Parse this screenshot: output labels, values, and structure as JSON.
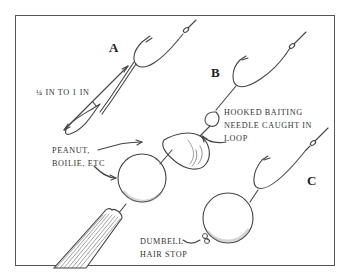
{
  "figure": {
    "panel_labels": {
      "a": "A",
      "b": "B",
      "c": "C"
    },
    "annotations": {
      "measure": "¼ IN TO 1 IN",
      "bait_line1": "PEANUT,",
      "bait_line2": "BOILIE, ETC",
      "needle_line1": "HOOKED BAITING",
      "needle_line2": "NEEDLE CAUGHT IN",
      "needle_line3": "LOOP",
      "stop_line1": "DUMBELL",
      "stop_line2": "HAIR STOP"
    },
    "colors": {
      "ink": "#333333",
      "frame": "#555555",
      "background": "#ffffff"
    }
  }
}
